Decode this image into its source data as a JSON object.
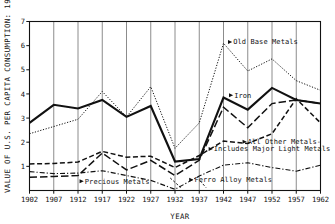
{
  "chart_data": {
    "type": "line",
    "title": "",
    "xlabel": "YEAR",
    "ylabel": "VALUE OF U.S. PER CAPITA CONSUMPTION: 1954 DOLLARS",
    "x": [
      1902,
      1907,
      1912,
      1917,
      1922,
      1927,
      1932,
      1937,
      1942,
      1947,
      1952,
      1957,
      1962
    ],
    "xticklabels": [
      "1902",
      "1907",
      "1912",
      "1917",
      "1922",
      "1927",
      "1932",
      "1937",
      "1942",
      "1947",
      "1952",
      "1957",
      "1962"
    ],
    "yticklabels": [
      "1",
      "2",
      "3",
      "4",
      "5",
      "6",
      "7"
    ],
    "yticks": [
      1,
      2,
      3,
      4,
      5,
      6,
      7
    ],
    "xlim": [
      1902,
      1962
    ],
    "ylim": [
      0,
      7
    ],
    "grid": "vertical",
    "legend": "inline-annotations",
    "series": [
      {
        "name": "Old Base Metals",
        "style": "dotted",
        "values": [
          2.35,
          2.65,
          2.95,
          4.1,
          3.05,
          4.3,
          1.75,
          2.8,
          6.1,
          4.95,
          5.45,
          4.55,
          4.15
        ]
      },
      {
        "name": "Iron",
        "style": "solid-heavy",
        "values": [
          2.8,
          3.55,
          3.4,
          3.75,
          3.05,
          3.5,
          1.2,
          1.3,
          3.85,
          3.35,
          4.25,
          3.75,
          3.6
        ]
      },
      {
        "name": "All Other Metals - Includes Major Light Metals",
        "style": "dashed",
        "values": [
          1.1,
          1.12,
          1.18,
          1.62,
          1.38,
          1.42,
          0.95,
          1.45,
          2.05,
          1.95,
          2.35,
          3.8,
          2.8
        ]
      },
      {
        "name": "Ferro Alloy Metals",
        "style": "long-dash",
        "values": [
          0.55,
          0.58,
          0.62,
          1.55,
          0.85,
          1.25,
          0.62,
          1.25,
          3.45,
          2.6,
          3.6,
          3.75,
          3.6
        ]
      },
      {
        "name": "Precious Metals",
        "style": "dash-dot",
        "values": [
          0.78,
          0.7,
          0.72,
          0.82,
          0.62,
          0.42,
          0.05,
          0.6,
          1.05,
          1.15,
          0.95,
          0.8,
          1.05
        ]
      }
    ],
    "annotations": [
      {
        "text": "Old Base Metals",
        "x": 1944.0,
        "y": 6.15
      },
      {
        "text": "Iron",
        "x": 1944.2,
        "y": 3.95
      },
      {
        "text": "All Other Metals-",
        "x": 1947.0,
        "y": 2.02
      },
      {
        "text": "Includes Major Light Metals",
        "x": 1940.0,
        "y": 1.72
      },
      {
        "text": "Precious Metals",
        "x": 1913.4,
        "y": 0.38
      },
      {
        "text": "Ferro Alloy Metals",
        "x": 1936.0,
        "y": 0.45
      }
    ]
  }
}
